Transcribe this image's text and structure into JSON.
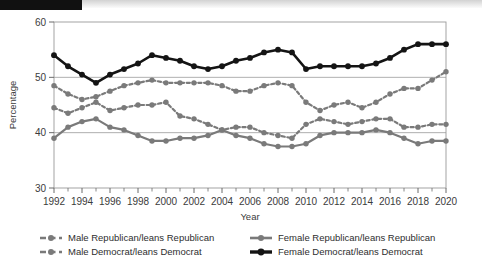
{
  "topbar": {
    "kind": "decorative-strip"
  },
  "chart_data": {
    "type": "line",
    "title": "",
    "xlabel": "Year",
    "ylabel": "Percentage",
    "ylim": [
      30,
      60
    ],
    "yticks": [
      30,
      40,
      50,
      60
    ],
    "xlim": [
      1992,
      2020
    ],
    "xticks": [
      1992,
      1994,
      1996,
      1998,
      2000,
      2002,
      2004,
      2006,
      2008,
      2010,
      2012,
      2014,
      2016,
      2018,
      2020
    ],
    "xtick_labels": [
      "1992",
      "1994",
      "1996",
      "1998",
      "2000",
      "2002",
      "2004",
      "2006",
      "2008",
      "2010",
      "2012",
      "2014",
      "2016",
      "2018",
      "2020"
    ],
    "grid": "horizontal",
    "legend_position": "bottom",
    "x": [
      1992,
      1993,
      1994,
      1995,
      1996,
      1997,
      1998,
      1999,
      2000,
      2001,
      2002,
      2003,
      2004,
      2005,
      2006,
      2007,
      2008,
      2009,
      2010,
      2011,
      2012,
      2013,
      2014,
      2015,
      2016,
      2017,
      2018,
      2019,
      2020
    ],
    "series": [
      {
        "name": "Male Republican/leans Republican",
        "style": "dashed",
        "color": "#7a7a7a",
        "values": [
          44.5,
          43.5,
          44.5,
          45.5,
          44.0,
          44.5,
          45.0,
          45.0,
          45.5,
          43.0,
          42.5,
          41.5,
          40.5,
          41.0,
          41.0,
          40.0,
          39.5,
          39.0,
          41.5,
          42.5,
          42.0,
          41.5,
          42.0,
          42.5,
          42.5,
          41.0,
          41.0,
          41.5,
          41.5
        ]
      },
      {
        "name": "Male Democrat/leans Democrat",
        "style": "dashed",
        "color": "#7a7a7a",
        "values": [
          48.5,
          47.0,
          46.0,
          46.5,
          47.5,
          48.5,
          49.0,
          49.5,
          49.0,
          49.0,
          49.0,
          49.0,
          48.5,
          47.5,
          47.5,
          48.5,
          49.0,
          48.5,
          45.5,
          44.0,
          45.0,
          45.5,
          44.5,
          45.5,
          47.0,
          48.0,
          48.0,
          49.5,
          51.0
        ]
      },
      {
        "name": "Female Republican/leans Republican",
        "style": "solid",
        "color": "#7a7a7a",
        "values": [
          39.0,
          41.0,
          42.0,
          42.5,
          41.0,
          40.5,
          39.5,
          38.5,
          38.5,
          39.0,
          39.0,
          39.5,
          40.5,
          39.5,
          39.0,
          38.0,
          37.5,
          37.5,
          38.0,
          39.5,
          40.0,
          40.0,
          40.0,
          40.5,
          40.0,
          39.0,
          38.0,
          38.5,
          38.5
        ]
      },
      {
        "name": "Female Democrat/leans Democrat",
        "style": "solid",
        "color": "#141414",
        "values": [
          54.0,
          52.0,
          50.5,
          49.0,
          50.5,
          51.5,
          52.5,
          54.0,
          53.5,
          53.0,
          52.0,
          51.5,
          52.0,
          53.0,
          53.5,
          54.5,
          55.0,
          54.5,
          51.5,
          52.0,
          52.0,
          52.0,
          52.0,
          52.5,
          53.5,
          55.0,
          56.0,
          56.0,
          56.0
        ]
      }
    ]
  },
  "legend": {
    "items": [
      {
        "label": "Male Republican/leans Republican",
        "style": "dashed",
        "color": "#7a7a7a"
      },
      {
        "label": "Female Republican/leans Republican",
        "style": "solid",
        "color": "#7a7a7a"
      },
      {
        "label": "Male Democrat/leans Democrat",
        "style": "dashed",
        "color": "#7a7a7a"
      },
      {
        "label": "Female Democrat/leans Democrat",
        "style": "solid",
        "color": "#141414"
      }
    ]
  }
}
